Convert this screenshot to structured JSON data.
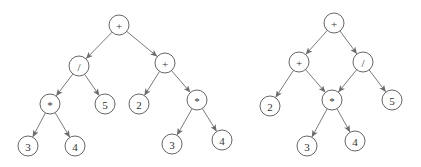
{
  "diagram": {
    "type": "expression-trees",
    "node_radius": 10,
    "colors": {
      "stroke": "#555555",
      "edge": "#6b6b6b",
      "text": "#333333",
      "background": "#ffffff"
    },
    "trees": [
      {
        "name": "expression-tree",
        "nodes": [
          {
            "id": "L0",
            "label": "+",
            "x": 119,
            "y": 25
          },
          {
            "id": "L1",
            "label": "/",
            "x": 79,
            "y": 66
          },
          {
            "id": "L2",
            "label": "+",
            "x": 165,
            "y": 63
          },
          {
            "id": "L3",
            "label": "*",
            "x": 50,
            "y": 104
          },
          {
            "id": "L4",
            "label": "5",
            "x": 105,
            "y": 104
          },
          {
            "id": "L5",
            "label": "2",
            "x": 139,
            "y": 104
          },
          {
            "id": "L6",
            "label": "*",
            "x": 197,
            "y": 100
          },
          {
            "id": "L7",
            "label": "3",
            "x": 28,
            "y": 146
          },
          {
            "id": "L8",
            "label": "4",
            "x": 75,
            "y": 146
          },
          {
            "id": "L9",
            "label": "3",
            "x": 172,
            "y": 144
          },
          {
            "id": "L10",
            "label": "4",
            "x": 222,
            "y": 140
          }
        ],
        "edges": [
          [
            "L0",
            "L1"
          ],
          [
            "L0",
            "L2"
          ],
          [
            "L1",
            "L3"
          ],
          [
            "L1",
            "L4"
          ],
          [
            "L2",
            "L5"
          ],
          [
            "L2",
            "L6"
          ],
          [
            "L3",
            "L7"
          ],
          [
            "L3",
            "L8"
          ],
          [
            "L6",
            "L9"
          ],
          [
            "L6",
            "L10"
          ]
        ]
      },
      {
        "name": "expression-dag",
        "nodes": [
          {
            "id": "R0",
            "label": "+",
            "x": 334,
            "y": 23
          },
          {
            "id": "R1",
            "label": "+",
            "x": 299,
            "y": 62
          },
          {
            "id": "R2",
            "label": "/",
            "x": 363,
            "y": 62
          },
          {
            "id": "R3",
            "label": "2",
            "x": 270,
            "y": 106
          },
          {
            "id": "R4",
            "label": "*",
            "x": 332,
            "y": 100
          },
          {
            "id": "R5",
            "label": "5",
            "x": 392,
            "y": 100
          },
          {
            "id": "R6",
            "label": "3",
            "x": 307,
            "y": 146
          },
          {
            "id": "R7",
            "label": "4",
            "x": 355,
            "y": 141
          }
        ],
        "edges": [
          [
            "R0",
            "R1"
          ],
          [
            "R0",
            "R2"
          ],
          [
            "R1",
            "R3"
          ],
          [
            "R1",
            "R4"
          ],
          [
            "R2",
            "R4"
          ],
          [
            "R2",
            "R5"
          ],
          [
            "R4",
            "R6"
          ],
          [
            "R4",
            "R7"
          ]
        ]
      }
    ]
  }
}
